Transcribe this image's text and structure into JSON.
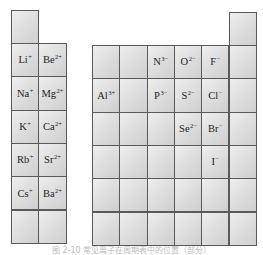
{
  "figure": {
    "caption": "图 2-10 常见离子在周期表中的位置（部分）",
    "colors": {
      "cell_light": "#eeeeee",
      "cell_dark": "#cfcfcf",
      "border": "#5a5a5a",
      "text": "#222222"
    }
  },
  "left_block": {
    "top_cell": {
      "row": 0,
      "col": 0,
      "symbol": "",
      "charge": ""
    },
    "cells": [
      {
        "row": 1,
        "col": 0,
        "symbol": "Li",
        "charge": "+"
      },
      {
        "row": 1,
        "col": 1,
        "symbol": "Be",
        "charge": "2+"
      },
      {
        "row": 2,
        "col": 0,
        "symbol": "Na",
        "charge": "+"
      },
      {
        "row": 2,
        "col": 1,
        "symbol": "Mg",
        "charge": "2+"
      },
      {
        "row": 3,
        "col": 0,
        "symbol": "K",
        "charge": "+"
      },
      {
        "row": 3,
        "col": 1,
        "symbol": "Ca",
        "charge": "2+"
      },
      {
        "row": 4,
        "col": 0,
        "symbol": "Rb",
        "charge": "+"
      },
      {
        "row": 4,
        "col": 1,
        "symbol": "Sr",
        "charge": "2+"
      },
      {
        "row": 5,
        "col": 0,
        "symbol": "Cs",
        "charge": "+"
      },
      {
        "row": 5,
        "col": 1,
        "symbol": "Ba",
        "charge": "2+"
      },
      {
        "row": 6,
        "col": 0,
        "symbol": "",
        "charge": ""
      },
      {
        "row": 6,
        "col": 1,
        "symbol": "",
        "charge": ""
      }
    ]
  },
  "right_block": {
    "top_cell": {
      "row": 0,
      "col": 5,
      "symbol": "",
      "charge": ""
    },
    "cells": [
      {
        "row": 1,
        "col": 0,
        "symbol": "",
        "charge": ""
      },
      {
        "row": 1,
        "col": 1,
        "symbol": "",
        "charge": ""
      },
      {
        "row": 1,
        "col": 2,
        "symbol": "N",
        "charge": "3−"
      },
      {
        "row": 1,
        "col": 3,
        "symbol": "O",
        "charge": "2−"
      },
      {
        "row": 1,
        "col": 4,
        "symbol": "F",
        "charge": "−"
      },
      {
        "row": 1,
        "col": 5,
        "symbol": "",
        "charge": ""
      },
      {
        "row": 2,
        "col": 0,
        "symbol": "Al",
        "charge": "3+"
      },
      {
        "row": 2,
        "col": 1,
        "symbol": "",
        "charge": ""
      },
      {
        "row": 2,
        "col": 2,
        "symbol": "P",
        "charge": "3−"
      },
      {
        "row": 2,
        "col": 3,
        "symbol": "S",
        "charge": "2−"
      },
      {
        "row": 2,
        "col": 4,
        "symbol": "Cl",
        "charge": "−"
      },
      {
        "row": 2,
        "col": 5,
        "symbol": "",
        "charge": ""
      },
      {
        "row": 3,
        "col": 0,
        "symbol": "",
        "charge": ""
      },
      {
        "row": 3,
        "col": 1,
        "symbol": "",
        "charge": ""
      },
      {
        "row": 3,
        "col": 2,
        "symbol": "",
        "charge": ""
      },
      {
        "row": 3,
        "col": 3,
        "symbol": "Se",
        "charge": "2−"
      },
      {
        "row": 3,
        "col": 4,
        "symbol": "Br",
        "charge": "−"
      },
      {
        "row": 3,
        "col": 5,
        "symbol": "",
        "charge": ""
      },
      {
        "row": 4,
        "col": 0,
        "symbol": "",
        "charge": ""
      },
      {
        "row": 4,
        "col": 1,
        "symbol": "",
        "charge": ""
      },
      {
        "row": 4,
        "col": 2,
        "symbol": "",
        "charge": ""
      },
      {
        "row": 4,
        "col": 3,
        "symbol": "",
        "charge": ""
      },
      {
        "row": 4,
        "col": 4,
        "symbol": "I",
        "charge": "−"
      },
      {
        "row": 4,
        "col": 5,
        "symbol": "",
        "charge": ""
      },
      {
        "row": 5,
        "col": 0,
        "symbol": "",
        "charge": ""
      },
      {
        "row": 5,
        "col": 1,
        "symbol": "",
        "charge": ""
      },
      {
        "row": 5,
        "col": 2,
        "symbol": "",
        "charge": ""
      },
      {
        "row": 5,
        "col": 3,
        "symbol": "",
        "charge": ""
      },
      {
        "row": 5,
        "col": 4,
        "symbol": "",
        "charge": ""
      },
      {
        "row": 5,
        "col": 5,
        "symbol": "",
        "charge": ""
      },
      {
        "row": 6,
        "col": 0,
        "symbol": "",
        "charge": ""
      },
      {
        "row": 6,
        "col": 1,
        "symbol": "",
        "charge": ""
      },
      {
        "row": 6,
        "col": 2,
        "symbol": "",
        "charge": ""
      },
      {
        "row": 6,
        "col": 3,
        "symbol": "",
        "charge": ""
      },
      {
        "row": 6,
        "col": 4,
        "symbol": "",
        "charge": ""
      },
      {
        "row": 6,
        "col": 5,
        "symbol": "",
        "charge": ""
      }
    ]
  }
}
